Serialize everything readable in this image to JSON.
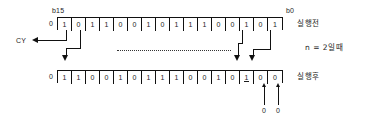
{
  "diagram": {
    "bit_labels": {
      "msb": "b15",
      "lsb": "b0"
    },
    "carry_label": "CY",
    "condition_note": "n = 2일때",
    "rows": [
      {
        "id": "before",
        "label": "실행전",
        "carry": "0",
        "bits": [
          "1",
          "0",
          "1",
          "1",
          "0",
          "0",
          "1",
          "0",
          "1",
          "1",
          "1",
          "0",
          "0",
          "1",
          "0",
          "1"
        ]
      },
      {
        "id": "after",
        "label": "실행후",
        "carry": "0",
        "bits": [
          "1",
          "1",
          "0",
          "0",
          "1",
          "0",
          "1",
          "1",
          "1",
          "0",
          "0",
          "1",
          "0",
          "1",
          "0",
          "0"
        ]
      }
    ],
    "fill_values": [
      "0",
      "0"
    ],
    "colors": {
      "line": "#111111",
      "text": "#1c1c1c",
      "background": "#ffffff"
    }
  }
}
